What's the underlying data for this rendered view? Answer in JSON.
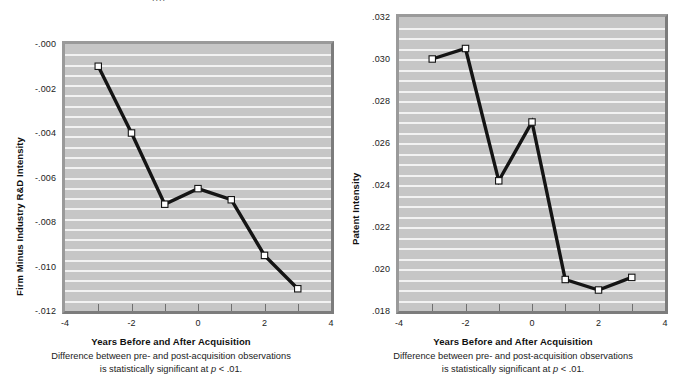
{
  "figure": {
    "top_cut_text": "....",
    "panels": [
      {
        "id": "rd-intensity",
        "note_line1": "Difference between pre- and post-acquisition observations",
        "note_line2_pre": "is statistically significant at ",
        "note_line2_ital": "p",
        "note_line2_post": " < .01."
      },
      {
        "id": "patent-intensity",
        "note_line1": "Difference between pre- and post-acquisition observations",
        "note_line2_pre": "is statistically significant at ",
        "note_line2_ital": "p",
        "note_line2_post": " < .01."
      }
    ]
  },
  "chart_data": [
    {
      "type": "line",
      "id": "rd-intensity",
      "title": "",
      "xlabel": "Years Before and After Acquisition",
      "ylabel": "Firm Minus Industry R&D Intensity",
      "x": [
        -3,
        -2,
        -1,
        0,
        1,
        2,
        3
      ],
      "values": [
        -0.001,
        -0.004,
        -0.0072,
        -0.0065,
        -0.007,
        -0.0095,
        -0.011
      ],
      "xlim": [
        -4,
        4
      ],
      "ylim": [
        -0.012,
        0.0
      ],
      "xticks": [
        -4,
        -2,
        0,
        2,
        4
      ],
      "xtick_labels": [
        "-4",
        "-2",
        "0",
        "2",
        "4"
      ],
      "yticks": [
        0.0,
        -0.002,
        -0.004,
        -0.006,
        -0.008,
        -0.01,
        -0.012
      ],
      "ytick_labels": [
        "-.000",
        "-.002",
        "-.004",
        "-.006",
        "-.008",
        "-.010",
        "-.012"
      ],
      "grid": true,
      "grid_orientation": "horizontal",
      "grid_count": 26,
      "marker": "open-square",
      "legend": null,
      "annotation": "Difference between pre- and post-acquisition observations is statistically significant at p < .01."
    },
    {
      "type": "line",
      "id": "patent-intensity",
      "title": "",
      "xlabel": "Years Before and After Acquisition",
      "ylabel": "Patent Intensity",
      "x": [
        -3,
        -2,
        -1,
        0,
        1,
        2,
        3
      ],
      "values": [
        0.03,
        0.0305,
        0.0242,
        0.027,
        0.0195,
        0.019,
        0.0196
      ],
      "xlim": [
        -4,
        4
      ],
      "ylim": [
        0.018,
        0.032
      ],
      "xticks": [
        -4,
        -2,
        0,
        2,
        4
      ],
      "xtick_labels": [
        "-4",
        "-2",
        "0",
        "2",
        "4"
      ],
      "yticks": [
        0.032,
        0.03,
        0.028,
        0.026,
        0.024,
        0.022,
        0.02,
        0.018
      ],
      "ytick_labels": [
        ".032",
        ".030",
        ".028",
        ".026",
        ".024",
        ".022",
        ".020",
        ".018"
      ],
      "grid": true,
      "grid_orientation": "horizontal",
      "grid_count": 28,
      "marker": "open-square",
      "legend": null,
      "annotation": "Difference between pre- and post-acquisition observations is statistically significant at p < .01."
    }
  ],
  "colors": {
    "plot_background": "#c6c6c6",
    "gridline": "#f2f2f2",
    "frame": "#8d8d8d",
    "series": "#141414",
    "marker_fill": "#ffffff",
    "page_background": "#ffffff",
    "text": "#1b1b1b"
  }
}
